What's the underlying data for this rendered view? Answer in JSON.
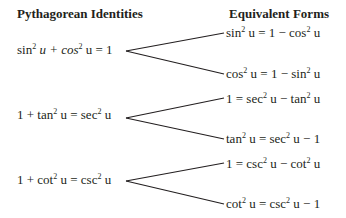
{
  "headers": {
    "left": "Pythagorean Identities",
    "right": "Equivalent Forms"
  },
  "identities": [
    {
      "parts": [
        "sin",
        "2",
        " u + cos",
        "2",
        " u = 1"
      ],
      "forms": [
        {
          "parts": [
            "sin",
            "2",
            " u = 1 − cos",
            "2",
            " u"
          ]
        },
        {
          "parts": [
            "cos",
            "2",
            " u = 1 − sin",
            "2",
            " u"
          ]
        }
      ]
    },
    {
      "parts": [
        "1 + tan",
        "2",
        " u = sec",
        "2",
        " u"
      ],
      "forms": [
        {
          "parts": [
            "1 = sec",
            "2",
            " u − tan",
            "2",
            " u"
          ]
        },
        {
          "parts": [
            "tan",
            "2",
            " u = sec",
            "2",
            " u − 1"
          ]
        }
      ]
    },
    {
      "parts": [
        "1 + cot",
        "2",
        " u = csc",
        "2",
        " u"
      ],
      "forms": [
        {
          "parts": [
            "1 = csc",
            "2",
            " u − cot",
            "2",
            " u"
          ]
        },
        {
          "parts": [
            "cot",
            "2",
            " u = csc",
            "2",
            " u − 1"
          ]
        }
      ]
    }
  ],
  "line_color": "#231f20"
}
